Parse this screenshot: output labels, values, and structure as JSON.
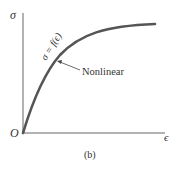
{
  "figure": {
    "caption": "(b)",
    "y_axis_label": "σ",
    "x_axis_label": "ϵ",
    "origin_label": "O",
    "curve_equation": "σ = f(ϵ)",
    "annotation": "Nonlinear",
    "colors": {
      "axis": "#555555",
      "curve": "#555555",
      "text": "#333333",
      "background": "#ffffff"
    }
  }
}
